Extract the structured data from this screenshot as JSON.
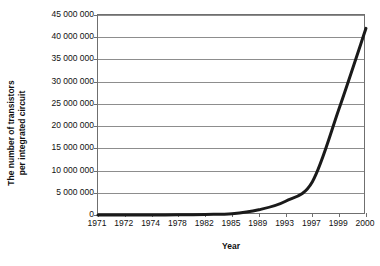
{
  "chart_data": {
    "type": "line",
    "title": "",
    "xlabel": "Year",
    "ylabel_line1": "The number of transistors",
    "ylabel_line2": "per integrated circuit",
    "categories": [
      "1971",
      "1972",
      "1974",
      "1978",
      "1982",
      "1985",
      "1989",
      "1993",
      "1997",
      "1999",
      "2000"
    ],
    "values": [
      2300,
      3500,
      6000,
      29000,
      134000,
      275000,
      1180000,
      3100000,
      7500000,
      24000000,
      42000000
    ],
    "series": [
      {
        "name": "Transistors per integrated circuit",
        "values": [
          2300,
          3500,
          6000,
          29000,
          134000,
          275000,
          1180000,
          3100000,
          7500000,
          24000000,
          42000000
        ]
      }
    ],
    "ylim": [
      0,
      45000000
    ],
    "ytick_step": 5000000,
    "ytick_labels": [
      "0",
      "5 000 000",
      "10 000 000",
      "15 000 000",
      "20 000 000",
      "25 000 000",
      "30 000 000",
      "35 000 000",
      "40 000 000",
      "45 000 000"
    ],
    "ytick_values": [
      0,
      5000000,
      10000000,
      15000000,
      20000000,
      25000000,
      30000000,
      35000000,
      40000000,
      45000000
    ],
    "grid": true,
    "legend": false,
    "legend_position": "none",
    "line_color": "#1a1a1a",
    "grid_color": "#8d8d8d",
    "axis_color": "#6f6f6f",
    "background_color": "#ffffff",
    "line_width": 3
  }
}
